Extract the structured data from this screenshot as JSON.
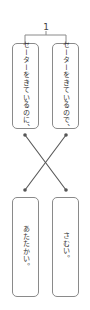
{
  "question": {
    "number": "1"
  },
  "top_cards": [
    {
      "text": "セーターをきているのに、"
    },
    {
      "text": "セーターをきているので、"
    }
  ],
  "bottom_cards": [
    {
      "text": "あたたかい。"
    },
    {
      "text": "さむい。"
    }
  ],
  "connections": [
    {
      "from": "top_cards.0",
      "to": "bottom_cards.1"
    },
    {
      "from": "top_cards.1",
      "to": "bottom_cards.0"
    }
  ],
  "colors": {
    "line": "#555555",
    "box_border": "#8a8a8a",
    "text": "#333333"
  }
}
